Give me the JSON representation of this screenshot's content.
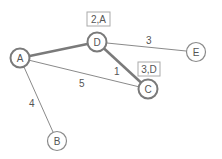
{
  "diagram": {
    "type": "weighted-graph",
    "nodes": [
      {
        "id": "A",
        "label": "A",
        "x": 20,
        "y": 58
      },
      {
        "id": "D",
        "label": "D",
        "x": 97,
        "y": 42
      },
      {
        "id": "E",
        "label": "E",
        "x": 196,
        "y": 52
      },
      {
        "id": "C",
        "label": "C",
        "x": 148,
        "y": 89
      },
      {
        "id": "B",
        "label": "B",
        "x": 57,
        "y": 141
      }
    ],
    "edges": [
      {
        "from": "A",
        "to": "D",
        "weight": "2",
        "highlighted": true
      },
      {
        "from": "D",
        "to": "E",
        "weight": "3",
        "highlighted": false
      },
      {
        "from": "D",
        "to": "C",
        "weight": "1",
        "highlighted": true
      },
      {
        "from": "A",
        "to": "C",
        "weight": "5",
        "highlighted": false
      },
      {
        "from": "A",
        "to": "B",
        "weight": "4",
        "highlighted": false
      }
    ],
    "edge_labels": [
      {
        "text": "3",
        "x": 146,
        "y": 44
      },
      {
        "text": "1",
        "x": 114,
        "y": 75
      },
      {
        "text": "5",
        "x": 79,
        "y": 87
      },
      {
        "text": "4",
        "x": 29,
        "y": 107
      }
    ],
    "node_annotations": [
      {
        "node": "D",
        "text": "2,A",
        "x": 87,
        "y": 12,
        "w": 23,
        "h": 14
      },
      {
        "node": "C",
        "text": "3,D",
        "x": 138,
        "y": 62,
        "w": 22,
        "h": 14
      }
    ],
    "colors": {
      "edge": "#8a8a8a",
      "edge_highlight": "#7a7a7a",
      "node_stroke": "#8a8a8a",
      "text": "#555555",
      "box_stroke": "#aaaaaa"
    }
  }
}
